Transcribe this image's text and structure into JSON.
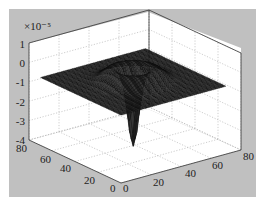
{
  "figure": {
    "background": "#c0c0c0",
    "axes_background": "#ffffff",
    "surface_color": "#1a1a1a"
  },
  "chart_data": {
    "type": "surface3d",
    "title": "",
    "xlabel": "",
    "ylabel": "",
    "zlabel": "",
    "z_exponent_label": "×10⁻⁵",
    "x_ticks": [
      "0",
      "20",
      "40",
      "60",
      "80"
    ],
    "y_ticks": [
      "0",
      "20",
      "40",
      "60",
      "80"
    ],
    "z_ticks": [
      "1",
      "0",
      "-1",
      "-2",
      "-3",
      "-4"
    ],
    "xlim": [
      0,
      80
    ],
    "ylim": [
      0,
      80
    ],
    "zlim": [
      -4e-05,
      1e-05
    ],
    "grid": true,
    "surface_features": {
      "edge_level": -5e-06,
      "rim_level": 0.0,
      "center_minimum": -4e-05
    }
  }
}
